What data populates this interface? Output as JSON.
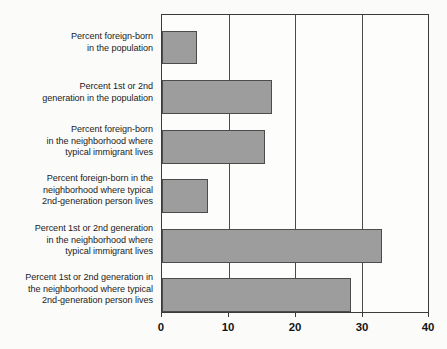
{
  "chart_data": {
    "type": "bar",
    "orientation": "horizontal",
    "title": "",
    "subtitle": "",
    "xlabel": "",
    "ylabel": "",
    "xlim": [
      0,
      40
    ],
    "ylim": null,
    "grid": true,
    "legend": null,
    "legend_position": "none",
    "xticks": [
      0,
      10,
      20,
      30,
      40
    ],
    "xtick_labels": [
      "0",
      "10",
      "20",
      "30",
      "40"
    ],
    "categories": [
      "Percent foreign-born in the population",
      "Percent 1st or 2nd generation in the population",
      "Percent foreign-born in the neighborhood where typical immigrant lives",
      "Percent foreign-born in the neighborhood where typical 2nd-generation person lives",
      "Percent 1st or 2nd generation in the neighborhood where typical immigrant lives",
      "Percent 1st or 2nd generation in the neighborhood where typical 2nd-generation person lives"
    ],
    "category_label_lines": [
      [
        "Percent foreign-born",
        "in the population"
      ],
      [
        "Percent 1st or 2nd",
        "generation in the population"
      ],
      [
        "Percent foreign-born",
        "in the neighborhood where",
        "typical immigrant lives"
      ],
      [
        "Percent foreign-born in the",
        "neighborhood where typical",
        "2nd-generation person lives"
      ],
      [
        "Percent 1st or 2nd generation",
        "in the neighborhood where",
        "typical immigrant lives"
      ],
      [
        "Percent 1st or 2nd generation in",
        "the neighborhood where typical",
        "2nd-generation person lives"
      ]
    ],
    "values": [
      5.2,
      16.6,
      15.5,
      6.9,
      33.1,
      28.4
    ],
    "bar_color": "#9d9d9d",
    "bar_edge_color": "#4c4c4c",
    "axis_color": "#3b3b3b",
    "background_color": "#fbfbfa"
  },
  "labels": {
    "cat0_l0": "Percent foreign-born",
    "cat0_l1": "in the population",
    "cat1_l0": "Percent 1st or 2nd",
    "cat1_l1": "generation in the population",
    "cat2_l0": "Percent foreign-born",
    "cat2_l1": "in the neighborhood where",
    "cat2_l2": "typical immigrant lives",
    "cat3_l0": "Percent foreign-born in the",
    "cat3_l1": "neighborhood where typical",
    "cat3_l2": "2nd-generation person lives",
    "cat4_l0": "Percent 1st or 2nd generation",
    "cat4_l1": "in the neighborhood where",
    "cat4_l2": "typical immigrant lives",
    "cat5_l0": "Percent 1st or 2nd generation in",
    "cat5_l1": "the neighborhood where typical",
    "cat5_l2": "2nd-generation person lives"
  },
  "axis": {
    "tick0": "0",
    "tick1": "10",
    "tick2": "20",
    "tick3": "30",
    "tick4": "40"
  }
}
